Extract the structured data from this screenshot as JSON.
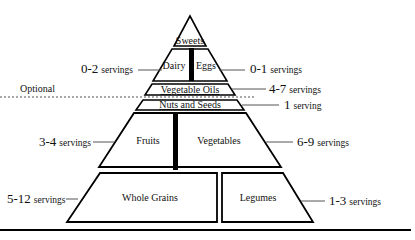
{
  "diagram": {
    "type": "food-pyramid",
    "tiers": [
      {
        "name": "Sweets",
        "label": "Sweets"
      },
      {
        "name": "Dairy",
        "label": "Dairy"
      },
      {
        "name": "Eggs",
        "label": "Eggs"
      },
      {
        "name": "Vegetable Oils",
        "label": "Vegetable Oils"
      },
      {
        "name": "Nuts and Seeds",
        "label": "Nuts and Seeds"
      },
      {
        "name": "Fruits",
        "label": "Fruits"
      },
      {
        "name": "Vegetables",
        "label": "Vegetables"
      },
      {
        "name": "Whole Grains",
        "label": "Whole Grains"
      },
      {
        "name": "Legumes",
        "label": "Legumes"
      }
    ],
    "servings": {
      "dairy": {
        "num": "0-2",
        "unit": "servings"
      },
      "eggs": {
        "num": "0-1",
        "unit": "servings"
      },
      "oils": {
        "num": "4-7",
        "unit": "servings"
      },
      "nuts": {
        "num": "1",
        "unit": "serving"
      },
      "fruits": {
        "num": "3-4",
        "unit": "servings"
      },
      "vegetables": {
        "num": "6-9",
        "unit": "servings"
      },
      "grains": {
        "num": "5-12",
        "unit": "servings"
      },
      "legumes": {
        "num": "1-3",
        "unit": "servings"
      }
    },
    "optional_label": "Optional"
  }
}
